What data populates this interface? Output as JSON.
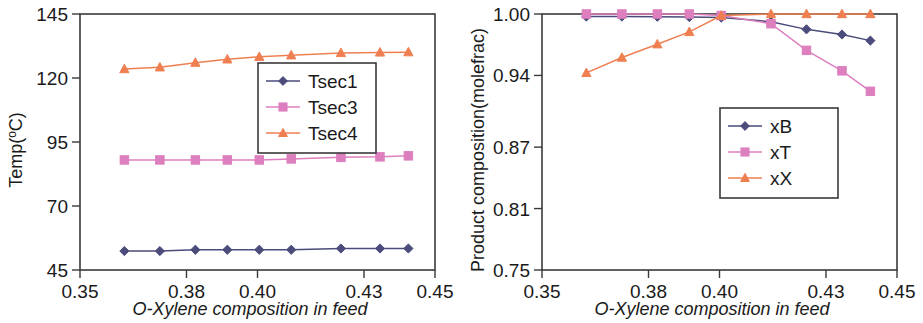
{
  "chart_data": [
    {
      "id": "left",
      "type": "line",
      "title": "",
      "xlabel": "O-Xylene composition in feed",
      "ylabel": "Temp(oC)",
      "ylabel_display": "Temp(°C)",
      "xlim": [
        0.35,
        0.45
      ],
      "ylim": [
        45,
        145
      ],
      "xticks": [
        "0.35",
        "0.38",
        "0.40",
        "0.43",
        "0.45"
      ],
      "xtick_values": [
        0.35,
        0.38,
        0.4,
        0.43,
        0.45
      ],
      "yticks": [
        "45",
        "70",
        "95",
        "120",
        "145"
      ],
      "ytick_values": [
        45,
        70,
        95,
        120,
        145
      ],
      "grid": false,
      "legend_position": "middle-right",
      "x": [
        0.3625,
        0.3725,
        0.3825,
        0.3915,
        0.4005,
        0.4095,
        0.4235,
        0.4345,
        0.4425
      ],
      "series": [
        {
          "name": "Tsec1",
          "color": "#4b4b7c",
          "marker": "diamond",
          "values": [
            52.4,
            52.4,
            52.9,
            52.9,
            52.9,
            52.9,
            53.4,
            53.4,
            53.4
          ]
        },
        {
          "name": "Tsec3",
          "color": "#dd7fbe",
          "marker": "square",
          "values": [
            88.0,
            88.0,
            88.0,
            88.0,
            88.0,
            88.4,
            89.0,
            89.2,
            89.6
          ]
        },
        {
          "name": "Tsec4",
          "color": "#ef7f51",
          "marker": "triangle",
          "values": [
            123.5,
            124.2,
            126.0,
            127.3,
            128.3,
            128.9,
            129.8,
            130.0,
            130.1
          ]
        }
      ]
    },
    {
      "id": "right",
      "type": "line",
      "title": "",
      "xlabel": "O-Xylene composition in feed",
      "ylabel": "Product composition(molefrac)",
      "xlim": [
        0.35,
        0.45
      ],
      "ylim": [
        0.75,
        1.0
      ],
      "xticks": [
        "0.35",
        "0.38",
        "0.40",
        "0.43",
        "0.45"
      ],
      "xtick_values": [
        0.35,
        0.38,
        0.4,
        0.43,
        0.45
      ],
      "yticks": [
        "0.75",
        "0.81",
        "0.87",
        "0.94",
        "1.00"
      ],
      "ytick_values": [
        0.75,
        0.81,
        0.87,
        0.94,
        1.0
      ],
      "grid": false,
      "legend_position": "lower-right",
      "x": [
        0.3625,
        0.3725,
        0.3825,
        0.3915,
        0.4005,
        0.4145,
        0.4245,
        0.4345,
        0.4425
      ],
      "series": [
        {
          "name": "xB",
          "color": "#4b4b7c",
          "marker": "diamond",
          "values": [
            0.9975,
            0.9975,
            0.9973,
            0.997,
            0.9965,
            0.9925,
            0.985,
            0.98,
            0.974
          ]
        },
        {
          "name": "xT",
          "color": "#dd7fbe",
          "marker": "square",
          "values": [
            1.0,
            1.0,
            1.0,
            1.0,
            0.9985,
            0.9905,
            0.9645,
            0.9445,
            0.9245
          ]
        },
        {
          "name": "xX",
          "color": "#ef7f51",
          "marker": "triangle",
          "values": [
            0.9425,
            0.9575,
            0.9705,
            0.9825,
            0.9985,
            1.0,
            1.0,
            1.0,
            1.0
          ]
        }
      ]
    }
  ],
  "panels": {
    "left": {
      "ylabel": "Temp(",
      "ylabel_sup": "o",
      "ylabel_tail": "C)",
      "xlabel": "O-Xylene composition in feed",
      "legend": [
        "Tsec1",
        "Tsec3",
        "Tsec4"
      ],
      "xticks": [
        "0.35",
        "0.38",
        "0.40",
        "0.43",
        "0.45"
      ],
      "yticks": [
        "45",
        "70",
        "95",
        "120",
        "145"
      ]
    },
    "right": {
      "ylabel": "Product composition(molefrac)",
      "xlabel": "O-Xylene composition in feed",
      "legend": [
        "xB",
        "xT",
        "xX"
      ],
      "xticks": [
        "0.35",
        "0.38",
        "0.40",
        "0.43",
        "0.45"
      ],
      "yticks": [
        "0.75",
        "0.81",
        "0.87",
        "0.94",
        "1.00"
      ]
    }
  }
}
